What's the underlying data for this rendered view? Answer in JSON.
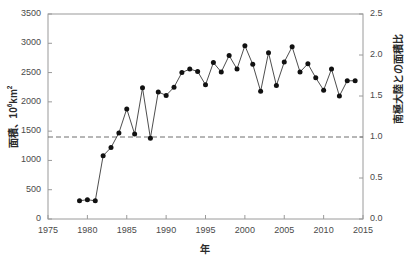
{
  "chart_data": {
    "type": "line",
    "title": "",
    "xlabel": "年",
    "ylabel": "面積、10⁶km²",
    "ylabel_right": "南極大陸との面積比",
    "xlim": [
      1975,
      2015
    ],
    "ylim": [
      0,
      3500
    ],
    "ylim_right": [
      0.0,
      2.5
    ],
    "grid": false,
    "legend": "none",
    "x_ticks": [
      "1975",
      "1980",
      "1985",
      "1990",
      "1995",
      "2000",
      "2005",
      "2010",
      "2015"
    ],
    "x_tick_values": [
      1975,
      1980,
      1985,
      1990,
      1995,
      2000,
      2005,
      2010,
      2015
    ],
    "y_ticks_left": [
      "0",
      "500",
      "1000",
      "1500",
      "2000",
      "2500",
      "3000",
      "3500"
    ],
    "y_tick_values_left": [
      0,
      500,
      1000,
      1500,
      2000,
      2500,
      3000,
      3500
    ],
    "y_ticks_right": [
      "0.0",
      "0.5",
      "1.0",
      "1.5",
      "2.0",
      "2.5"
    ],
    "y_tick_values_right": [
      0.0,
      0.5,
      1.0,
      1.5,
      2.0,
      2.5
    ],
    "reference_line": {
      "label": "",
      "y_value": 1400,
      "style": "dashed"
    },
    "x": [
      1979,
      1980,
      1981,
      1982,
      1983,
      1984,
      1985,
      1986,
      1987,
      1988,
      1989,
      1990,
      1991,
      1992,
      1993,
      1994,
      1995,
      1996,
      1997,
      1998,
      1999,
      2000,
      2001,
      2002,
      2003,
      2004,
      2005,
      2006,
      2007,
      2008,
      2009,
      2010,
      2011,
      2012,
      2013,
      2014
    ],
    "values": [
      310,
      330,
      310,
      1080,
      1220,
      1470,
      1880,
      1450,
      2240,
      1380,
      2170,
      2110,
      2250,
      2500,
      2560,
      2520,
      2290,
      2670,
      2510,
      2790,
      2560,
      2960,
      2640,
      2180,
      2840,
      2280,
      2680,
      2940,
      2510,
      2650,
      2410,
      2200,
      2560,
      2100,
      2360,
      2360
    ],
    "marker": "filled-circle",
    "line_color": "#3a3a3a",
    "marker_color": "#111111"
  },
  "axes": {
    "left_title_text": "面積、10",
    "left_title_sup": "6",
    "left_title_suffix": "km",
    "left_title_sup2": "2",
    "right_title": "南極大陸との面積比",
    "x_title": "年"
  },
  "colors": {
    "axis": "#9a9a9a",
    "text": "#3a3a3a",
    "line": "#3a3a3a",
    "marker": "#111111",
    "reference": "#6f6f6f",
    "background": "#ffffff"
  }
}
